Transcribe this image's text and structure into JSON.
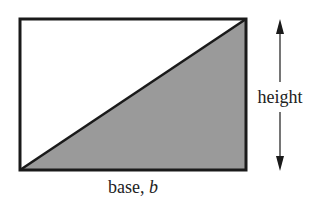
{
  "diagram": {
    "labels": {
      "height": "height",
      "base_prefix": "base, ",
      "base_var": "b"
    },
    "colors": {
      "stroke": "#1a1a1a",
      "fill_triangle": "#9a9a9a",
      "background": "#ffffff"
    }
  }
}
